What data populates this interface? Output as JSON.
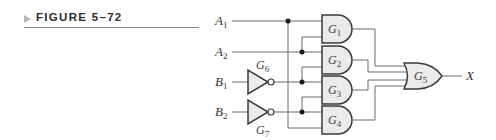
{
  "figure": {
    "label": "FIGURE 5–72",
    "arrow_icon": "right-triangle-icon",
    "accent_color": "#b8b8b8"
  },
  "circuit": {
    "inputs": [
      {
        "name": "A",
        "sub": "1"
      },
      {
        "name": "A",
        "sub": "2"
      },
      {
        "name": "B",
        "sub": "1"
      },
      {
        "name": "B",
        "sub": "2"
      }
    ],
    "inverters": [
      {
        "name": "G",
        "sub": "6",
        "input": "B1"
      },
      {
        "name": "G",
        "sub": "7",
        "input": "B2"
      }
    ],
    "and_gates": [
      {
        "name": "G",
        "sub": "1",
        "inputs": [
          "A1",
          "A2"
        ]
      },
      {
        "name": "G",
        "sub": "2",
        "inputs": [
          "A2",
          "B1'"
        ]
      },
      {
        "name": "G",
        "sub": "3",
        "inputs": [
          "B1'",
          "B2'"
        ]
      },
      {
        "name": "G",
        "sub": "4",
        "inputs": [
          "B2'",
          "A1"
        ]
      }
    ],
    "or_gate": {
      "name": "G",
      "sub": "5",
      "inputs": [
        "G1",
        "G2",
        "G3",
        "G4"
      ]
    },
    "output": {
      "name": "X"
    },
    "colors": {
      "gate_fill": "#ebebeb",
      "gate_stroke": "#3a3a3a",
      "wire": "#6b6b6b"
    }
  }
}
